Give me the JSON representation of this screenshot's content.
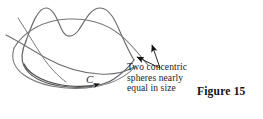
{
  "figure": {
    "label": "Figure 15",
    "contour_label": "C",
    "caption_lines": [
      "Two concentric",
      "spheres nearly",
      "equal in size"
    ],
    "colors": {
      "curve_stroke": "#6b6b6b",
      "contour_stroke": "#5a5a5a",
      "arrow_fill": "#1a1a1a",
      "text": "#1a1a1a",
      "background": "#ffffff"
    },
    "icons": {
      "contour_direction_arrow": "arrowhead-icon",
      "leader_arrow_upper": "arrowhead-icon",
      "leader_arrow_lower": "arrowhead-icon"
    }
  }
}
